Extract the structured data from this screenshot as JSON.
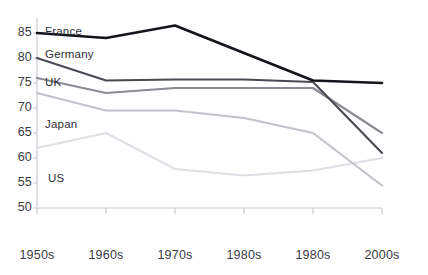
{
  "chart_data": {
    "type": "line",
    "title": "",
    "xlabel": "",
    "ylabel": "",
    "x": [
      "1950s",
      "1960s",
      "1970s",
      "1980s",
      "1980s",
      "2000s"
    ],
    "categories": [
      "1950s",
      "1960s",
      "1970s",
      "1980s",
      "1980s",
      "2000s"
    ],
    "xtick_labels": [
      "1950s",
      "1960s",
      "1970s",
      "1980s",
      "1980s",
      "2000s"
    ],
    "ytick_labels": [
      "85",
      "80",
      "75",
      "70",
      "65",
      "60",
      "55",
      "50"
    ],
    "yticks": [
      85,
      80,
      75,
      70,
      65,
      60,
      55,
      50
    ],
    "ylim": [
      50,
      87.5
    ],
    "grid": false,
    "legend_position": "inline-left",
    "series": [
      {
        "name": "France",
        "color": "#14141a",
        "label_x": 45,
        "label_y": 25,
        "values": [
          85.0,
          84.0,
          86.5,
          81.0,
          75.5,
          75.0
        ]
      },
      {
        "name": "Germany",
        "color": "#4a4a52",
        "label_x": 45,
        "label_y": 48,
        "values": [
          80.0,
          75.5,
          75.7,
          75.7,
          75.2,
          61.0
        ]
      },
      {
        "name": "UK",
        "color": "#8b8b93",
        "label_x": 45,
        "label_y": 76,
        "values": [
          76.0,
          73.0,
          74.0,
          74.0,
          74.0,
          65.0
        ]
      },
      {
        "name": "Japan",
        "color": "#c2c2ca",
        "label_x": 45,
        "label_y": 118,
        "values": [
          73.0,
          69.5,
          69.5,
          68.0,
          65.0,
          54.5
        ]
      },
      {
        "name": "US",
        "color": "#dfdfe6",
        "label_x": 48,
        "label_y": 172,
        "values": [
          62.0,
          65.0,
          57.8,
          56.5,
          57.5,
          60.0
        ]
      }
    ]
  },
  "axis": {
    "y_label_x": 16,
    "x_label_y": 248,
    "ytick_y": [
      33,
      58,
      83,
      108,
      133,
      158,
      183,
      208
    ],
    "xtick_x": [
      37,
      106,
      175,
      244,
      313,
      382
    ]
  }
}
